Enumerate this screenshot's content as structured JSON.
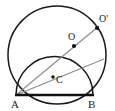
{
  "figure": {
    "kind": "geometry-diagram",
    "background_color": "#ffffff",
    "stroke_color": "#1a1a1a",
    "ray_color": "#8a8a8a",
    "point_color": "#111111",
    "labels": {
      "a": "A",
      "b": "B",
      "c": "C",
      "o": "O",
      "o_prime": "O'"
    },
    "points": {
      "A": {
        "x": 16,
        "y": 95
      },
      "B": {
        "x": 93,
        "y": 95
      },
      "C": {
        "x": 53,
        "y": 77
      },
      "O": {
        "x": 74,
        "y": 46
      },
      "O_prime": {
        "x": 97,
        "y": 28
      }
    },
    "label_positions": {
      "A": {
        "x": 11,
        "y": 108
      },
      "B": {
        "x": 89,
        "y": 108
      },
      "C": {
        "x": 57,
        "y": 82
      },
      "O": {
        "x": 68,
        "y": 39
      },
      "O_prime": {
        "x": 100,
        "y": 22
      }
    },
    "outer_circle": {
      "cx": 57,
      "cy": 55,
      "r": 49
    },
    "inner_semicircle": {
      "cx": 54.5,
      "cy": 95,
      "r": 38.5
    },
    "segments": [
      {
        "name": "chord-AB",
        "x1": 16,
        "y1": 95,
        "x2": 93,
        "y2": 95,
        "weight": "bold"
      },
      {
        "name": "ray-A-to-O-prime",
        "x1": 16,
        "y1": 95,
        "x2": 99,
        "y2": 26,
        "weight": "thin"
      },
      {
        "name": "ray-A-to-circle-right",
        "x1": 16,
        "y1": 95,
        "x2": 104,
        "y2": 59,
        "weight": "thin"
      }
    ]
  }
}
